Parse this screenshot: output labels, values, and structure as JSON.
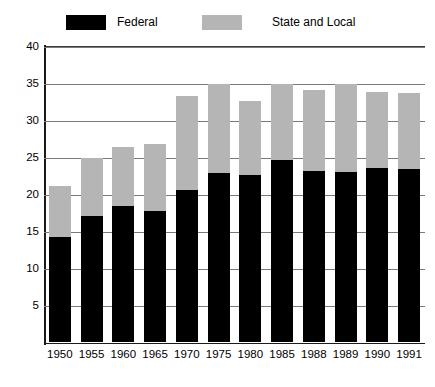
{
  "legend": {
    "entries": [
      {
        "label": "Federal",
        "color": "#000000",
        "icon": "legend-swatch-black"
      },
      {
        "label": "State and Local",
        "color": "#b5b5b5",
        "icon": "legend-swatch-gray"
      }
    ]
  },
  "axis": {
    "y_ticks": [
      "40",
      "35",
      "30",
      "25",
      "20",
      "15",
      "10",
      "5"
    ],
    "y_tick_values": [
      40,
      35,
      30,
      25,
      20,
      15,
      10,
      5
    ]
  },
  "chart_data": {
    "type": "bar",
    "title": "",
    "subtitle": "",
    "xlabel": "",
    "ylabel": "",
    "stacked": true,
    "grid": true,
    "legend_position": "top",
    "ylim": [
      0,
      40
    ],
    "ytick_step": 5,
    "categories": [
      "1950",
      "1955",
      "1960",
      "1965",
      "1970",
      "1975",
      "1980",
      "1985",
      "1988",
      "1989",
      "1990",
      "1991"
    ],
    "series": [
      {
        "name": "Federal",
        "color": "#000000",
        "values": [
          14.3,
          17.1,
          18.4,
          17.8,
          20.6,
          22.9,
          22.6,
          24.7,
          23.2,
          23.0,
          23.6,
          23.5
        ]
      },
      {
        "name": "State and Local",
        "color": "#b5b5b5",
        "values": [
          6.9,
          7.9,
          8.0,
          9.0,
          12.7,
          12.1,
          10.1,
          10.3,
          10.9,
          12.0,
          10.3,
          10.2
        ]
      }
    ],
    "totals": [
      21.2,
      25.0,
      26.4,
      26.8,
      33.3,
      35.0,
      32.7,
      35.0,
      34.1,
      35.0,
      33.9,
      33.7
    ]
  }
}
